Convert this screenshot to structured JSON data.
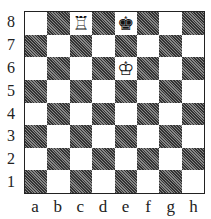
{
  "board": {
    "files": [
      "a",
      "b",
      "c",
      "d",
      "e",
      "f",
      "g",
      "h"
    ],
    "ranks": [
      "8",
      "7",
      "6",
      "5",
      "4",
      "3",
      "2",
      "1"
    ],
    "dark_square_color": "#555555",
    "light_square_color": "#ffffff",
    "pieces": [
      {
        "square": "c8",
        "piece": "rook",
        "color": "white",
        "glyph": "♖"
      },
      {
        "square": "e8",
        "piece": "king",
        "color": "black",
        "glyph": "♚"
      },
      {
        "square": "e6",
        "piece": "king",
        "color": "white",
        "glyph": "♔"
      }
    ]
  }
}
